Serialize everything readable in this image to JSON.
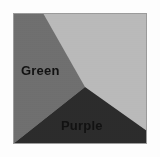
{
  "figure": {
    "background_color": "#fdfdfd",
    "border_color": "#9a9a9a",
    "regions": [
      {
        "id": "upper-right-region",
        "label": "",
        "color": "#b9b9b9",
        "polygon": "30,0 134,0 134,118 72,74",
        "label_x": 0,
        "label_y": 0
      },
      {
        "id": "green-region",
        "label": "Green",
        "color": "#6e6e6e",
        "polygon": "0,0 30,0 72,74 0,131",
        "label_x": 8,
        "label_y": 62
      },
      {
        "id": "purple-region",
        "label": "Purple",
        "color": "#2b2b2b",
        "polygon": "0,131 72,74 134,118 134,131",
        "label_x": 48,
        "label_y": 117
      }
    ]
  }
}
